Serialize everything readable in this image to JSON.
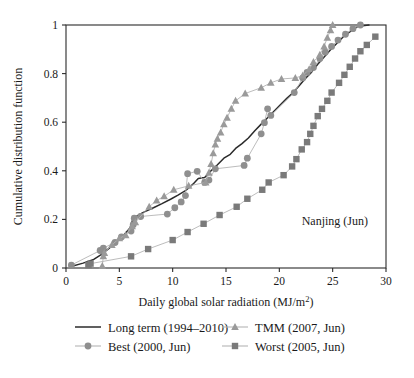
{
  "chart_data": {
    "type": "line",
    "title": "",
    "annotation": "Nanjing (Jun)",
    "xlabel": "Daily global solar radiation (MJ/m²)",
    "ylabel": "Cumulative distribution function",
    "xlim": [
      0,
      30
    ],
    "ylim": [
      0,
      1
    ],
    "xticks": [
      0,
      5,
      10,
      15,
      20,
      25,
      30
    ],
    "yticks": [
      0,
      0.2,
      0.4,
      0.6,
      0.8,
      1
    ],
    "xtick_labels": [
      "0",
      "5",
      "10",
      "15",
      "20",
      "25",
      "30"
    ],
    "ytick_labels": [
      "0",
      "0.2",
      "0.4",
      "0.6",
      "0.8",
      "1"
    ],
    "grid": false,
    "legend_position": "below-axes",
    "series": [
      {
        "name": "Long term (1994–2010)",
        "marker": "none",
        "color": "#2b2b2b",
        "points": [
          [
            0.4,
            0.005
          ],
          [
            1.6,
            0.02
          ],
          [
            2.6,
            0.035
          ],
          [
            3.3,
            0.055
          ],
          [
            4.0,
            0.08
          ],
          [
            4.7,
            0.105
          ],
          [
            5.4,
            0.135
          ],
          [
            6.0,
            0.165
          ],
          [
            6.3,
            0.205
          ],
          [
            6.8,
            0.218
          ],
          [
            7.4,
            0.232
          ],
          [
            8.2,
            0.248
          ],
          [
            9.0,
            0.265
          ],
          [
            9.8,
            0.283
          ],
          [
            10.5,
            0.3
          ],
          [
            11.2,
            0.318
          ],
          [
            11.9,
            0.345
          ],
          [
            12.4,
            0.368
          ],
          [
            13.0,
            0.372
          ],
          [
            13.6,
            0.4
          ],
          [
            14.2,
            0.425
          ],
          [
            14.8,
            0.452
          ],
          [
            15.4,
            0.468
          ],
          [
            15.9,
            0.492
          ],
          [
            16.5,
            0.512
          ],
          [
            17.1,
            0.535
          ],
          [
            17.7,
            0.565
          ],
          [
            18.3,
            0.592
          ],
          [
            18.9,
            0.618
          ],
          [
            19.5,
            0.645
          ],
          [
            20.1,
            0.672
          ],
          [
            20.7,
            0.698
          ],
          [
            21.3,
            0.722
          ],
          [
            21.9,
            0.752
          ],
          [
            22.4,
            0.778
          ],
          [
            23.0,
            0.805
          ],
          [
            23.6,
            0.838
          ],
          [
            24.2,
            0.868
          ],
          [
            24.8,
            0.898
          ],
          [
            25.4,
            0.925
          ],
          [
            26.0,
            0.952
          ],
          [
            26.7,
            0.975
          ],
          [
            27.4,
            0.995
          ],
          [
            28.4,
            1.0
          ]
        ]
      },
      {
        "name": "Best (2000, Jun)",
        "marker": "circle",
        "color": "#8f8f8f",
        "points": [
          [
            0.5,
            0.012
          ],
          [
            3.2,
            0.072
          ],
          [
            3.5,
            0.082
          ],
          [
            4.6,
            0.105
          ],
          [
            5.2,
            0.128
          ],
          [
            6.1,
            0.152
          ],
          [
            6.3,
            0.178
          ],
          [
            6.4,
            0.205
          ],
          [
            7.0,
            0.212
          ],
          [
            9.5,
            0.222
          ],
          [
            10.2,
            0.248
          ],
          [
            10.8,
            0.272
          ],
          [
            11.2,
            0.298
          ],
          [
            11.4,
            0.388
          ],
          [
            12.3,
            0.398
          ],
          [
            13.0,
            0.352
          ],
          [
            13.4,
            0.362
          ],
          [
            14.0,
            0.408
          ],
          [
            16.7,
            0.422
          ],
          [
            17.0,
            0.452
          ],
          [
            18.3,
            0.552
          ],
          [
            18.6,
            0.598
          ],
          [
            18.9,
            0.655
          ],
          [
            19.2,
            0.628
          ],
          [
            21.4,
            0.722
          ],
          [
            22.2,
            0.782
          ],
          [
            22.6,
            0.805
          ],
          [
            23.2,
            0.825
          ],
          [
            23.8,
            0.862
          ],
          [
            24.3,
            0.888
          ],
          [
            24.9,
            0.912
          ],
          [
            25.5,
            0.938
          ],
          [
            26.2,
            0.962
          ],
          [
            26.9,
            0.985
          ],
          [
            27.6,
            1.0
          ]
        ]
      },
      {
        "name": "TMM (2007, Jun)",
        "marker": "triangle",
        "color": "#9a9a9a",
        "points": [
          [
            3.4,
            0.008
          ],
          [
            3.5,
            0.048
          ],
          [
            3.6,
            0.062
          ],
          [
            4.3,
            0.095
          ],
          [
            5.0,
            0.122
          ],
          [
            5.6,
            0.135
          ],
          [
            6.2,
            0.172
          ],
          [
            6.5,
            0.188
          ],
          [
            7.8,
            0.252
          ],
          [
            8.5,
            0.278
          ],
          [
            9.2,
            0.295
          ],
          [
            10.1,
            0.322
          ],
          [
            11.5,
            0.338
          ],
          [
            13.1,
            0.352
          ],
          [
            13.4,
            0.392
          ],
          [
            13.6,
            0.428
          ],
          [
            13.8,
            0.472
          ],
          [
            14.0,
            0.508
          ],
          [
            14.2,
            0.532
          ],
          [
            14.5,
            0.558
          ],
          [
            14.8,
            0.592
          ],
          [
            15.1,
            0.618
          ],
          [
            15.5,
            0.655
          ],
          [
            15.9,
            0.688
          ],
          [
            16.8,
            0.718
          ],
          [
            18.3,
            0.742
          ],
          [
            19.2,
            0.762
          ],
          [
            20.2,
            0.778
          ],
          [
            21.5,
            0.782
          ],
          [
            22.2,
            0.792
          ],
          [
            22.8,
            0.818
          ],
          [
            23.2,
            0.848
          ],
          [
            23.8,
            0.878
          ],
          [
            24.2,
            0.912
          ],
          [
            24.5,
            0.948
          ],
          [
            24.8,
            0.978
          ],
          [
            25.0,
            1.0
          ]
        ]
      },
      {
        "name": "Worst (2005, Jun)",
        "marker": "square",
        "color": "#7a7a7a",
        "points": [
          [
            2.1,
            0.012
          ],
          [
            2.3,
            0.018
          ],
          [
            6.1,
            0.048
          ],
          [
            7.7,
            0.078
          ],
          [
            10.0,
            0.115
          ],
          [
            11.4,
            0.148
          ],
          [
            12.9,
            0.182
          ],
          [
            14.4,
            0.218
          ],
          [
            16.0,
            0.252
          ],
          [
            17.0,
            0.285
          ],
          [
            18.4,
            0.322
          ],
          [
            19.0,
            0.352
          ],
          [
            20.4,
            0.382
          ],
          [
            21.2,
            0.418
          ],
          [
            21.6,
            0.448
          ],
          [
            22.1,
            0.488
          ],
          [
            22.6,
            0.518
          ],
          [
            22.9,
            0.552
          ],
          [
            23.2,
            0.585
          ],
          [
            23.6,
            0.625
          ],
          [
            24.0,
            0.655
          ],
          [
            24.5,
            0.688
          ],
          [
            24.9,
            0.722
          ],
          [
            25.6,
            0.762
          ],
          [
            26.1,
            0.795
          ],
          [
            26.6,
            0.828
          ],
          [
            27.1,
            0.862
          ],
          [
            27.6,
            0.892
          ],
          [
            28.2,
            0.918
          ],
          [
            29.0,
            0.952
          ]
        ]
      }
    ]
  },
  "axes": {
    "x_title": "Daily global solar radiation (MJ/m",
    "x_title_sup": "2",
    "x_title_end": ")",
    "y_title": "Cumulative distribution function"
  },
  "annotation": {
    "label": "Nanjing (Jun)"
  },
  "legend": {
    "entries": [
      {
        "label": "Long term (1994–2010)",
        "marker": "line",
        "color": "#2b2b2b"
      },
      {
        "label": "TMM (2007, Jun)",
        "marker": "triangle",
        "color": "#9a9a9a"
      },
      {
        "label": "Best (2000, Jun)",
        "marker": "circle",
        "color": "#8f8f8f"
      },
      {
        "label": "Worst (2005, Jun)",
        "marker": "square",
        "color": "#7a7a7a"
      }
    ]
  }
}
